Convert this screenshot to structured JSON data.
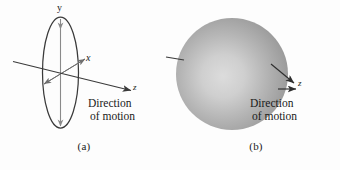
{
  "figure": {
    "panels": [
      {
        "id": "a",
        "caption": "(a)",
        "shape": "ellipse",
        "direction_text_line1": "Direction",
        "direction_text_line2": "of motion",
        "axis_labels": {
          "y": "y",
          "x": "x",
          "z": "z"
        }
      },
      {
        "id": "b",
        "caption": "(b)",
        "shape": "sphere",
        "direction_text_line1": "Direction",
        "direction_text_line2": "of motion",
        "axis_labels": {
          "z": "z"
        }
      }
    ],
    "colors": {
      "background": "#fdfdfd",
      "stroke": "#3a3a3a",
      "text": "#1a1a1a",
      "sphere_light": "#d8d8d8",
      "sphere_mid": "#a9a9a9",
      "sphere_dark": "#8e8e8e"
    }
  }
}
